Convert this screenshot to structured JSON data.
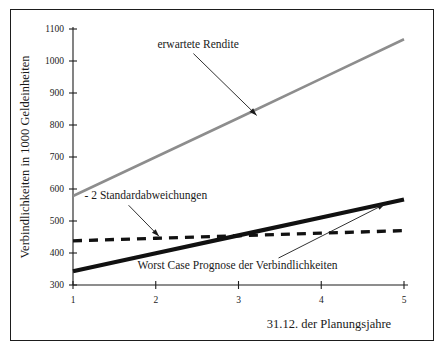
{
  "figure": {
    "border_color": "#1d1d1d",
    "background": "#ffffff"
  },
  "chart_data": {
    "type": "line",
    "title": "",
    "xlabel": "31.12. der Planungsjahre",
    "ylabel": "Verbindlichkeiten in 1000 Geldeinheiten",
    "x": [
      1,
      2,
      3,
      4,
      5
    ],
    "xticklabels": [
      "1",
      "2",
      "3",
      "4",
      "5"
    ],
    "yticks": [
      300,
      400,
      500,
      600,
      700,
      800,
      900,
      1000,
      1100
    ],
    "yticklabels": [
      "300",
      "400",
      "500",
      "600",
      "700",
      "800",
      "900",
      "1000",
      "1100"
    ],
    "xlim": [
      1,
      5
    ],
    "ylim": [
      300,
      1100
    ],
    "grid": false,
    "legend": "none",
    "series": [
      {
        "name": "erwartete Rendite",
        "style": "solid",
        "color": "#8d8d8d",
        "width": 2.6,
        "values": [
          578,
          700,
          822,
          945,
          1068
        ]
      },
      {
        "name": "Worst Case Prognose der Verbindlichkeiten",
        "style": "solid",
        "color": "#111111",
        "width": 4.2,
        "values": [
          343,
          399,
          455,
          511,
          567
        ]
      },
      {
        "name": "- 2 Standardabweichungen",
        "style": "dashed",
        "color": "#111111",
        "width": 3.4,
        "values": [
          438,
          446,
          454,
          462,
          470
        ]
      }
    ],
    "annotations": [
      {
        "id": "expected-return",
        "text": "erwartete Rendite",
        "text_x": 2.02,
        "text_y": 1042,
        "point_x": 3.22,
        "point_y": 830
      },
      {
        "id": "two-std-dev",
        "text": "- 2 Standardabweichungen",
        "text_x": 1.14,
        "text_y": 568,
        "point_x": 2.04,
        "point_y": 452
      },
      {
        "id": "worst-case",
        "text": "Worst Case Prognose der Verbindlichkeiten",
        "text_x": 1.78,
        "text_y": 350,
        "point_x": 4.77,
        "point_y": 553
      }
    ]
  }
}
